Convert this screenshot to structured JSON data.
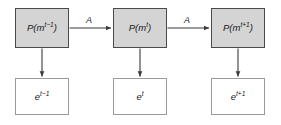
{
  "diagram": {
    "background_color": "#ffffff",
    "state_fill_color": "#d4d4d4",
    "state_border_color": "#4a4a4a",
    "emission_fill_color": "#ffffff",
    "emission_border_color": "#9a9a9a",
    "edge_color": "#3a3a3a",
    "states": [
      {
        "id": "state-prev",
        "base": "P(m",
        "superscript": "t−1",
        "close": ")"
      },
      {
        "id": "state-curr",
        "base": "P(m",
        "superscript": "t",
        "close": ")"
      },
      {
        "id": "state-next",
        "base": "P(m",
        "superscript": "t+1",
        "close": ")"
      }
    ],
    "emissions": [
      {
        "id": "emission-prev",
        "base": "e",
        "superscript": "t−1"
      },
      {
        "id": "emission-curr",
        "base": "e",
        "superscript": "t"
      },
      {
        "id": "emission-next",
        "base": "e",
        "superscript": "t+1"
      }
    ],
    "transition_labels": [
      {
        "id": "transition-prev-curr",
        "label": "A"
      },
      {
        "id": "transition-curr-next",
        "label": "A"
      }
    ]
  }
}
